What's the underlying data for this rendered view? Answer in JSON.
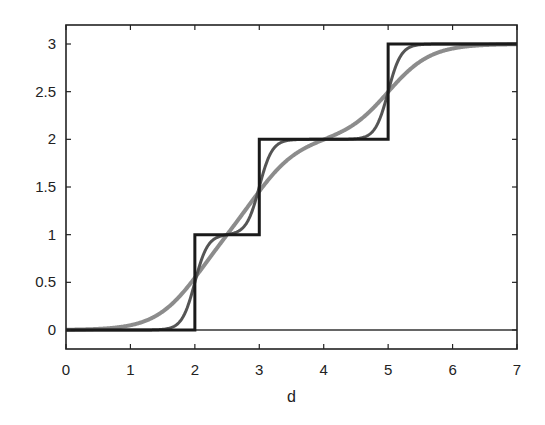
{
  "chart_data": {
    "type": "line",
    "title": "",
    "xlabel": "d",
    "ylabel": "",
    "xlim": [
      0,
      7
    ],
    "ylim": [
      -0.2,
      3.2
    ],
    "grid": false,
    "legend": null,
    "x_ticks": [
      0,
      1,
      2,
      3,
      4,
      5,
      6,
      7
    ],
    "x_tick_labels": [
      "0",
      "1",
      "2",
      "3",
      "4",
      "5",
      "6",
      "7"
    ],
    "y_ticks": [
      0,
      0.5,
      1,
      1.5,
      2,
      2.5,
      3
    ],
    "y_tick_labels": [
      "0",
      "0.5",
      "1",
      "1.5",
      "2",
      "2.5",
      "3"
    ],
    "step_centers": [
      2,
      3,
      5
    ],
    "series": [
      {
        "name": "step function",
        "style": "step",
        "color": "#1a1a1a",
        "width": 3,
        "x": [
          0,
          2,
          2,
          3,
          3,
          5,
          5,
          7
        ],
        "values": [
          0,
          0,
          1,
          1,
          2,
          2,
          3,
          3
        ]
      },
      {
        "name": "sharp sigmoid sum",
        "style": "sigmoid_sum",
        "steepness": 10,
        "color": "#555555",
        "width": 3,
        "x": [
          0,
          1.5,
          1.8,
          1.9,
          2,
          2.1,
          2.2,
          2.5,
          2.8,
          2.9,
          3,
          3.1,
          3.2,
          3.5,
          4,
          4.5,
          4.8,
          4.9,
          5,
          5.1,
          5.2,
          5.5,
          6,
          7
        ],
        "values": [
          0,
          0.007,
          0.12,
          0.27,
          0.5,
          0.73,
          0.88,
          1.0,
          1.12,
          1.27,
          1.5,
          1.73,
          1.88,
          2.0,
          2.0,
          2.007,
          2.12,
          2.27,
          2.5,
          2.73,
          2.88,
          2.99,
          3.0,
          3.0
        ]
      },
      {
        "name": "smooth sigmoid sum",
        "style": "sigmoid_sum",
        "steepness": 3,
        "color": "#8c8c8c",
        "width": 4,
        "x": [
          0,
          0.5,
          1,
          1.5,
          2,
          2.5,
          3,
          3.5,
          4,
          4.5,
          5,
          5.5,
          6,
          6.5,
          7
        ],
        "values": [
          0.003,
          0.011,
          0.05,
          0.19,
          0.55,
          1.0,
          1.46,
          1.82,
          2.0,
          2.17,
          2.5,
          2.82,
          2.95,
          2.99,
          3.0
        ]
      }
    ]
  },
  "axes": {
    "frame_color": "#222222",
    "zero_line_color": "#333333"
  }
}
